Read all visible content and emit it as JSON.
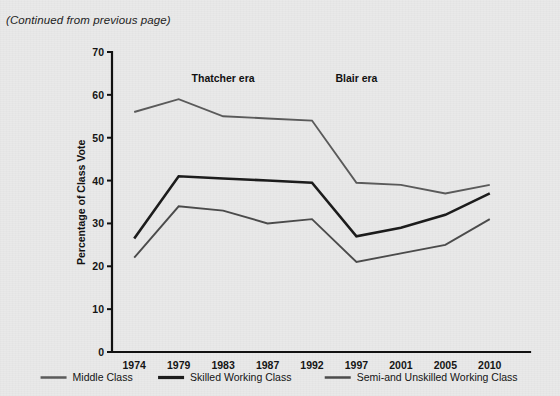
{
  "page": {
    "continued_note": "(Continued from previous page)",
    "background_color": "#e9e9e9",
    "ink_color": "#111111"
  },
  "chart_data": {
    "type": "line",
    "title": "",
    "xlabel": "",
    "ylabel": "Percentage of Class Vote",
    "categories": [
      "1974",
      "1979",
      "1983",
      "1987",
      "1992",
      "1997",
      "2001",
      "2005",
      "2010"
    ],
    "x": [
      1974,
      1979,
      1983,
      1987,
      1992,
      1997,
      2001,
      2005,
      2010
    ],
    "ylim": [
      0,
      70
    ],
    "yticks": [
      0,
      10,
      20,
      30,
      40,
      50,
      60,
      70
    ],
    "ytick_labels": [
      "0",
      "10",
      "20",
      "30",
      "40",
      "50",
      "60",
      "70"
    ],
    "grid": false,
    "legend_position": "bottom",
    "series": [
      {
        "name": "Middle Class",
        "color": "#5a5a5a",
        "values": [
          56,
          59,
          55,
          54.5,
          54,
          39.5,
          39,
          37,
          39
        ]
      },
      {
        "name": "Skilled Working Class",
        "color": "#1c1c1c",
        "values": [
          26.5,
          41,
          40.5,
          40,
          39.5,
          27,
          29,
          32,
          37
        ]
      },
      {
        "name": "Semi-and Unskilled Working Class",
        "color": "#4b4b4b",
        "values": [
          22,
          34,
          33,
          30,
          31,
          21,
          23,
          25,
          31
        ]
      }
    ],
    "annotations": [
      {
        "text": "Thatcher era",
        "x_category": "1983",
        "y_value": 63
      },
      {
        "text": "Blair era",
        "x_category": "1997",
        "y_value": 63
      }
    ],
    "legend": [
      {
        "label": "Middle Class",
        "color": "#5a5a5a"
      },
      {
        "label": "Skilled Working Class",
        "color": "#1c1c1c"
      },
      {
        "label": "Semi-and Unskilled Working Class",
        "color": "#4b4b4b"
      }
    ]
  }
}
